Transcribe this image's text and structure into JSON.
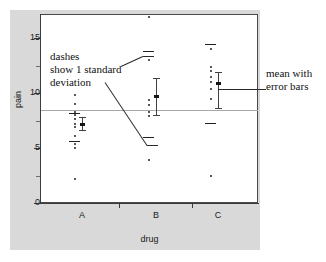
{
  "chart_data": {
    "type": "scatter",
    "title": "",
    "xlabel": "drug",
    "ylabel": "pain",
    "ylim": [
      0,
      17.5
    ],
    "ytick_labels": [
      "0",
      "5",
      "10",
      "15"
    ],
    "ytick_values": [
      0,
      5,
      10,
      15
    ],
    "yminor_values": [
      2.5,
      7.5,
      12.5,
      17.5
    ],
    "categories": [
      "A",
      "B",
      "C"
    ],
    "grid": false,
    "legend": "none",
    "reference_line": {
      "value": 8.5,
      "color": "#a8a8a8",
      "label": ""
    },
    "series": [
      {
        "name": "A",
        "points": [
          9.8,
          9.0,
          8.3,
          8.0,
          7.6,
          7.2,
          6.9,
          6.1,
          5.4,
          5.0,
          2.2
        ],
        "mean": 7.2,
        "error_low": 6.6,
        "error_high": 7.8,
        "sd_dashes": [
          8.2,
          5.6
        ]
      },
      {
        "name": "B",
        "points": [
          16.9,
          13.0,
          9.4,
          8.9,
          8.3,
          7.9,
          3.9
        ],
        "mean": 9.7,
        "error_low": 8.0,
        "error_high": 11.4,
        "sd_dashes": [
          13.8,
          6.0
        ]
      },
      {
        "name": "C",
        "points": [
          14.0,
          12.4,
          12.0,
          11.5,
          11.0,
          10.4,
          9.5,
          2.5
        ],
        "mean": 10.9,
        "error_low": 8.6,
        "error_high": 11.9,
        "sd_dashes": [
          14.5,
          7.3
        ]
      }
    ]
  },
  "annotations": {
    "left_note": {
      "line1": "dashes",
      "line2": "show 1 standard",
      "line3": "deviation"
    },
    "right_note": {
      "line1": "mean with",
      "line2": "error bars"
    }
  }
}
